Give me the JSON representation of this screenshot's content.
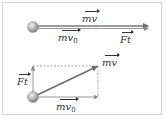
{
  "diagram": {
    "title": "",
    "colors": {
      "vector": "#6b6b6b",
      "dashed": "#8a8a8a",
      "ball": "#a8a8a8",
      "frame": "#d4d4d4",
      "text": "#333333"
    },
    "top_panel": {
      "description": "Collinear momentum vectors: mv0 + Ft = mv",
      "labels": {
        "resultant": "mv",
        "initial": "mv",
        "initial_sub": "0",
        "impulse": "Ft"
      }
    },
    "bottom_panel": {
      "description": "Perpendicular momentum vectors: mv0 and Ft combine into diagonal mv",
      "labels": {
        "resultant": "mv",
        "initial": "mv",
        "initial_sub": "0",
        "impulse": "Ft"
      }
    }
  }
}
